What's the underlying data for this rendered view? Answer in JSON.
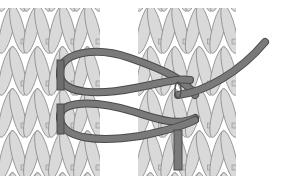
{
  "figure": {
    "background": "#ffffff",
    "colors": {
      "stitch_fill": "#d9d9d9",
      "stitch_stroke": "#8c8c8c",
      "bar_fill": "#cfcfcf",
      "yarn": "#6e6e6e",
      "yarn_edge": "#4a4a4a"
    },
    "panels": [
      {
        "name": "left-fabric",
        "x": 0,
        "width": 100,
        "columns": 4
      },
      {
        "name": "right-fabric",
        "x": 138,
        "width": 98,
        "columns": 4
      }
    ],
    "rows": 4
  }
}
